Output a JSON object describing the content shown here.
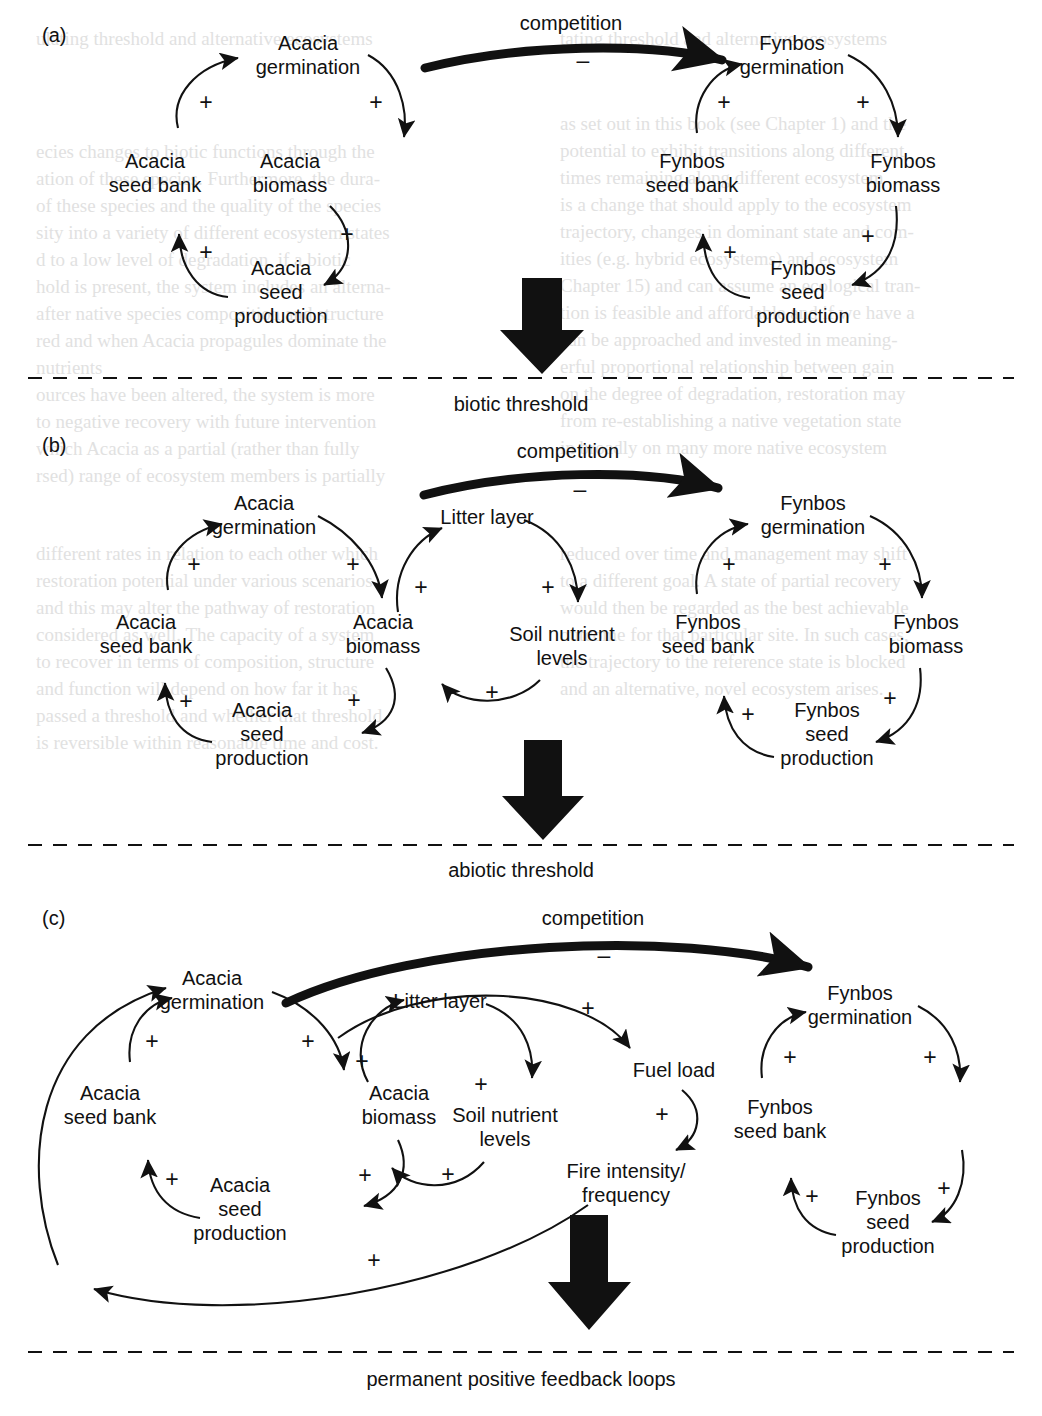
{
  "figure": {
    "type": "causal-loop-diagram",
    "panels": [
      {
        "id": "(a)",
        "threshold_label": "biotic threshold",
        "edge_label": "competition",
        "edge_sign": "–",
        "nodes": [
          {
            "key": "acacia_germination",
            "label": "Acacia\ngermination",
            "l1": "Acacia",
            "l2": "germination"
          },
          {
            "key": "acacia_biomass",
            "label": "Acacia\nbiomass",
            "l1": "Acacia",
            "l2": "biomass"
          },
          {
            "key": "acacia_seed_production",
            "label": "Acacia\nseed\nproduction",
            "l1": "Acacia",
            "l2": "seed",
            "l3": "production"
          },
          {
            "key": "acacia_seed_bank",
            "label": "Acacia\nseed bank",
            "l1": "Acacia",
            "l2": "seed bank"
          },
          {
            "key": "fynbos_germination",
            "label": "Fynbos\ngermination",
            "l1": "Fynbos",
            "l2": "germination"
          },
          {
            "key": "fynbos_biomass",
            "label": "Fynbos\nbiomass",
            "l1": "Fynbos",
            "l2": "biomass"
          },
          {
            "key": "fynbos_seed_production",
            "label": "Fynbos\nseed\nproduction",
            "l1": "Fynbos",
            "l2": "seed",
            "l3": "production"
          },
          {
            "key": "fynbos_seed_bank",
            "label": "Fynbos\nseed bank",
            "l1": "Fynbos",
            "l2": "seed bank"
          }
        ],
        "signs": [
          "+",
          "+",
          "+",
          "+",
          "+",
          "+",
          "+",
          "+"
        ]
      },
      {
        "id": "(b)",
        "threshold_label": "abiotic threshold",
        "edge_label": "competition",
        "edge_sign": "–",
        "nodes": [
          {
            "key": "acacia_germination",
            "l1": "Acacia",
            "l2": "germination"
          },
          {
            "key": "acacia_biomass",
            "l1": "Acacia",
            "l2": "biomass"
          },
          {
            "key": "acacia_seed_production",
            "l1": "Acacia",
            "l2": "seed",
            "l3": "production"
          },
          {
            "key": "acacia_seed_bank",
            "l1": "Acacia",
            "l2": "seed bank"
          },
          {
            "key": "litter_layer",
            "l1": "Litter layer"
          },
          {
            "key": "soil_nutrient_levels",
            "l1": "Soil nutrient",
            "l2": "levels"
          },
          {
            "key": "fynbos_germination",
            "l1": "Fynbos",
            "l2": "germination"
          },
          {
            "key": "fynbos_biomass",
            "l1": "Fynbos",
            "l2": "biomass"
          },
          {
            "key": "fynbos_seed_production",
            "l1": "Fynbos",
            "l2": "seed",
            "l3": "production"
          },
          {
            "key": "fynbos_seed_bank",
            "l1": "Fynbos",
            "l2": "seed bank"
          }
        ],
        "signs": [
          "+",
          "+",
          "+",
          "+",
          "+",
          "+",
          "+",
          "+",
          "+",
          "+",
          "+",
          "+"
        ]
      },
      {
        "id": "(c)",
        "threshold_label": "permanent positive feedback loops",
        "edge_label": "competition",
        "edge_sign": "–",
        "nodes": [
          {
            "key": "acacia_germination",
            "l1": "Acacia",
            "l2": "germination"
          },
          {
            "key": "acacia_biomass",
            "l1": "Acacia",
            "l2": "biomass"
          },
          {
            "key": "acacia_seed_production",
            "l1": "Acacia",
            "l2": "seed",
            "l3": "production"
          },
          {
            "key": "acacia_seed_bank",
            "l1": "Acacia",
            "l2": "seed bank"
          },
          {
            "key": "litter_layer",
            "l1": "Litter layer"
          },
          {
            "key": "soil_nutrient_levels",
            "l1": "Soil nutrient",
            "l2": "levels"
          },
          {
            "key": "fuel_load",
            "l1": "Fuel load"
          },
          {
            "key": "fire_intensity_frequency",
            "l1": "Fire intensity/",
            "l2": "frequency"
          },
          {
            "key": "fynbos_germination",
            "l1": "Fynbos",
            "l2": "germination"
          },
          {
            "key": "fynbos_seed_production",
            "l1": "Fynbos",
            "l2": "seed",
            "l3": "production"
          },
          {
            "key": "fynbos_seed_bank",
            "l1": "Fynbos",
            "l2": "seed bank"
          }
        ],
        "signs": [
          "+",
          "+",
          "+",
          "+",
          "+",
          "+",
          "+",
          "+",
          "+",
          "+",
          "+",
          "+",
          "+",
          "+"
        ]
      }
    ]
  },
  "labels": {
    "panel_a_id": "(a)",
    "panel_b_id": "(b)",
    "panel_c_id": "(c)",
    "competition": "competition",
    "minus": "–",
    "plus": "+",
    "biotic_threshold": "biotic threshold",
    "abiotic_threshold": "abiotic threshold",
    "permanent_loops": "permanent positive feedback loops",
    "acacia": "Acacia",
    "fynbos": "Fynbos",
    "germination": "germination",
    "biomass": "biomass",
    "seed": "seed",
    "production": "production",
    "seed_bank": "seed bank",
    "litter_layer": "Litter layer",
    "soil_nutrient": "Soil nutrient",
    "levels": "levels",
    "fuel_load": "Fuel load",
    "fire_intensity": "Fire intensity/",
    "frequency": "frequency"
  },
  "colors": {
    "ink": "#111111",
    "paper": "#ffffff",
    "ghost_text": "#c9c9c9"
  }
}
